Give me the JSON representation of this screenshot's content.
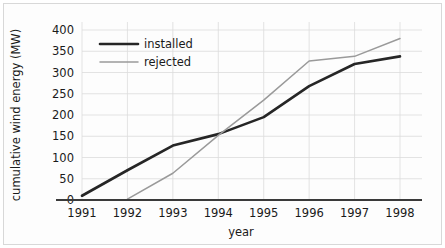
{
  "chart_data": {
    "type": "line",
    "title": "",
    "xlabel": "year",
    "ylabel": "cumulative wind energy (MW)",
    "x": [
      1991,
      1992,
      1993,
      1994,
      1995,
      1996,
      1997,
      1998
    ],
    "categories": [
      "1991",
      "1992",
      "1993",
      "1994",
      "1995",
      "1996",
      "1997",
      "1998"
    ],
    "xlim": [
      1991,
      1998
    ],
    "ylim": [
      0,
      400
    ],
    "yticks": [
      0,
      50,
      100,
      150,
      200,
      250,
      300,
      350,
      400
    ],
    "ytick_labels": [
      "0",
      "50",
      "100",
      "150",
      "200",
      "250",
      "300",
      "350",
      "400"
    ],
    "xticks": [
      1991,
      1992,
      1993,
      1994,
      1995,
      1996,
      1997,
      1998
    ],
    "xtick_labels": [
      "1991",
      "1992",
      "1993",
      "1994",
      "1995",
      "1996",
      "1997",
      "1998"
    ],
    "grid": true,
    "legend_position": "upper-left-inside",
    "series": [
      {
        "name": "installed",
        "color": "#262626",
        "line_width": 2.6,
        "x": [
          1991,
          1992,
          1993,
          1994,
          1995,
          1996,
          1997,
          1998
        ],
        "values": [
          10,
          70,
          128,
          155,
          195,
          268,
          320,
          338
        ]
      },
      {
        "name": "rejected",
        "color": "#9a9a9a",
        "line_width": 1.5,
        "x": [
          1992,
          1993,
          1994,
          1995,
          1996,
          1997,
          1998
        ],
        "values": [
          2,
          63,
          152,
          235,
          327,
          338,
          380
        ]
      }
    ]
  },
  "legend": {
    "entries": [
      {
        "label": "installed"
      },
      {
        "label": "rejected"
      }
    ]
  },
  "colors": {
    "installed": "#262626",
    "rejected": "#9a9a9a",
    "grid": "#dcdcdc",
    "axis": "#3a3a3a",
    "text": "#1a1a1a",
    "background": "#ffffff",
    "frame_border": "#d8d8d8"
  }
}
